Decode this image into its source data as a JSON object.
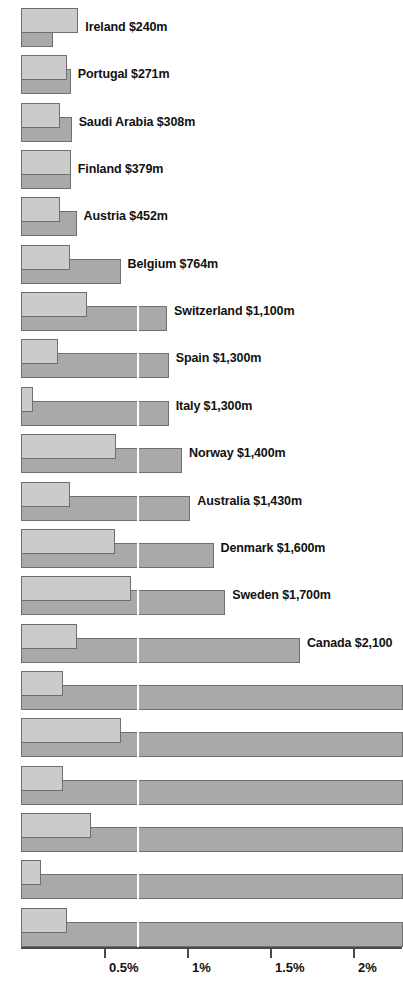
{
  "chart_data": {
    "type": "bar",
    "title": "",
    "subtitle": "",
    "xlabel": "",
    "ylabel": "",
    "orientation": "horizontal",
    "grid": false,
    "legend_position": "none",
    "xlim": [
      0,
      2.3
    ],
    "xtick_values": [
      0.5,
      1,
      1.5,
      2
    ],
    "xtick_labels": [
      "0.5%",
      "1%",
      "1.5%",
      "2%"
    ],
    "guide_line_value": 0.7,
    "guide_line_color": "#ffffff",
    "colors": {
      "light_series": "#cbcbcb",
      "dark_series": "#a9a9a9",
      "bar_border": "#6f6f6f",
      "axis": "#4a4a4a",
      "text": "#111111",
      "background": "#ffffff"
    },
    "series": [
      {
        "name": "light",
        "values": [
          0.345,
          0.28,
          0.235,
          0.3,
          0.235,
          0.295,
          0.4,
          0.225,
          0.07,
          0.575,
          0.295,
          0.565,
          0.66,
          0.34,
          0.25,
          0.6,
          0.25,
          0.42,
          0.12,
          0.275
        ]
      },
      {
        "name": "dark",
        "values": [
          0.195,
          0.3,
          0.305,
          0.3,
          0.335,
          0.6,
          0.88,
          0.89,
          0.89,
          0.97,
          1.02,
          1.16,
          1.23,
          1.68,
          2.3,
          2.3,
          2.3,
          2.3,
          2.3,
          2.3
        ]
      }
    ],
    "rows": [
      {
        "label": "Ireland $240m",
        "light": 0.345,
        "dark": 0.195,
        "label_shown": true
      },
      {
        "label": "Portugal $271m",
        "light": 0.28,
        "dark": 0.3,
        "label_shown": true
      },
      {
        "label": "Saudi Arabia $308m",
        "light": 0.235,
        "dark": 0.305,
        "label_shown": true
      },
      {
        "label": "Finland $379m",
        "light": 0.3,
        "dark": 0.3,
        "label_shown": true
      },
      {
        "label": "Austria $452m",
        "light": 0.235,
        "dark": 0.335,
        "label_shown": true
      },
      {
        "label": "Belgium $764m",
        "light": 0.295,
        "dark": 0.6,
        "label_shown": true
      },
      {
        "label": "Switzerland $1,100m",
        "light": 0.4,
        "dark": 0.88,
        "label_shown": true
      },
      {
        "label": "Spain $1,300m",
        "light": 0.225,
        "dark": 0.89,
        "label_shown": true
      },
      {
        "label": "Italy $1,300m",
        "light": 0.07,
        "dark": 0.89,
        "label_shown": true
      },
      {
        "label": "Norway $1,400m",
        "light": 0.575,
        "dark": 0.97,
        "label_shown": true
      },
      {
        "label": "Australia $1,430m",
        "light": 0.295,
        "dark": 1.02,
        "label_shown": true
      },
      {
        "label": "Denmark $1,600m",
        "light": 0.565,
        "dark": 1.16,
        "label_shown": true
      },
      {
        "label": "Sweden $1,700m",
        "light": 0.66,
        "dark": 1.23,
        "label_shown": true
      },
      {
        "label": "Canada $2,100",
        "light": 0.34,
        "dark": 1.68,
        "label_shown": true
      },
      {
        "label": "",
        "light": 0.25,
        "dark": 2.3,
        "label_shown": false
      },
      {
        "label": "",
        "light": 0.6,
        "dark": 2.3,
        "label_shown": false
      },
      {
        "label": "",
        "light": 0.25,
        "dark": 2.3,
        "label_shown": false
      },
      {
        "label": "",
        "light": 0.42,
        "dark": 2.3,
        "label_shown": false
      },
      {
        "label": "",
        "light": 0.12,
        "dark": 2.3,
        "label_shown": false
      },
      {
        "label": "",
        "light": 0.275,
        "dark": 2.3,
        "label_shown": false
      }
    ]
  },
  "axis": {
    "ticks": [
      {
        "label": "0.5%",
        "value": 0.5
      },
      {
        "label": "1%",
        "value": 1
      },
      {
        "label": "1.5%",
        "value": 1.5
      },
      {
        "label": "2%",
        "value": 2
      }
    ]
  }
}
